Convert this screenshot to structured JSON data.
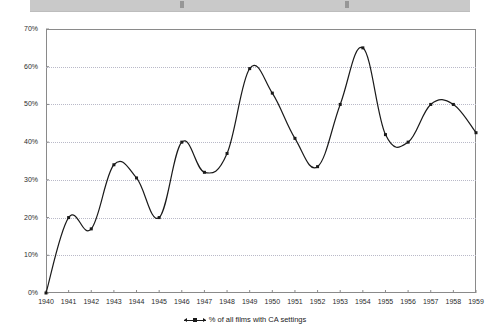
{
  "top_strip": {
    "present": true,
    "color": "#c9c9c9"
  },
  "chart_data": {
    "type": "line",
    "title": "",
    "subtitle": "",
    "xlabel": "",
    "ylabel": "",
    "categories": [
      "1940",
      "1941",
      "1942",
      "1943",
      "1944",
      "1945",
      "1946",
      "1947",
      "1948",
      "1949",
      "1950",
      "1951",
      "1952",
      "1953",
      "1954",
      "1955",
      "1956",
      "1957",
      "1958",
      "1959"
    ],
    "values": [
      0,
      20,
      17,
      34,
      30.5,
      20,
      40,
      32,
      37,
      59.5,
      53,
      41,
      33.5,
      50,
      65,
      42,
      40,
      50,
      50,
      42.5
    ],
    "series": [
      {
        "name": "% of all films with CA settings",
        "values": [
          0,
          20,
          17,
          34,
          30.5,
          20,
          40,
          32,
          37,
          59.5,
          53,
          41,
          33.5,
          50,
          65,
          42,
          40,
          50,
          50,
          42.5
        ],
        "color": "#1a1a1a",
        "marker": "square",
        "smoothing": "spline"
      }
    ],
    "ylim": [
      0,
      70
    ],
    "ytick_values": [
      0,
      10,
      20,
      30,
      40,
      50,
      60,
      70
    ],
    "ytick_labels": [
      "0%",
      "10%",
      "20%",
      "30%",
      "40%",
      "50%",
      "60%",
      "70%"
    ],
    "xtick_labels": [
      "1940",
      "1941",
      "1942",
      "1943",
      "1944",
      "1945",
      "1946",
      "1947",
      "1948",
      "1949",
      "1950",
      "1951",
      "1952",
      "1953",
      "1954",
      "1955",
      "1956",
      "1957",
      "1958",
      "1959"
    ],
    "grid": {
      "horizontal": true,
      "vertical": false,
      "style": "dotted",
      "color": "#b9b9c8"
    },
    "legend": {
      "position": "bottom",
      "entries": [
        {
          "label": "% of all films with CA settings",
          "marker": "square",
          "color": "#1a1a1a"
        }
      ]
    },
    "plot_border_color": "#8a8a8a",
    "background": "#ffffff"
  }
}
